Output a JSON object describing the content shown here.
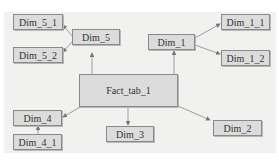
{
  "diagram": {
    "type": "star-schema",
    "fact": {
      "id": "fact",
      "label": "Fact_tab_1"
    },
    "nodes": [
      {
        "id": "dim5_1",
        "label": "Dim_5_1"
      },
      {
        "id": "dim5_2",
        "label": "Dim_5_2"
      },
      {
        "id": "dim5",
        "label": "Dim_5"
      },
      {
        "id": "dim1",
        "label": "Dim_1"
      },
      {
        "id": "dim1_1",
        "label": "Dim_1_1"
      },
      {
        "id": "dim1_2",
        "label": "Dim_1_2"
      },
      {
        "id": "dim4",
        "label": "Dim_4"
      },
      {
        "id": "dim4_1",
        "label": "Dim_4_1"
      },
      {
        "id": "dim3",
        "label": "Dim_3"
      },
      {
        "id": "dim2",
        "label": "Dim_2"
      }
    ],
    "edges": [
      {
        "from": "fact",
        "to": "dim5"
      },
      {
        "from": "fact",
        "to": "dim1"
      },
      {
        "from": "fact",
        "to": "dim4"
      },
      {
        "from": "fact",
        "to": "dim3"
      },
      {
        "from": "fact",
        "to": "dim2"
      },
      {
        "from": "dim5",
        "to": "dim5_1"
      },
      {
        "from": "dim5",
        "to": "dim5_2"
      },
      {
        "from": "dim1",
        "to": "dim1_1"
      },
      {
        "from": "dim1",
        "to": "dim1_2"
      },
      {
        "from": "dim4_1",
        "to": "dim4"
      }
    ]
  }
}
